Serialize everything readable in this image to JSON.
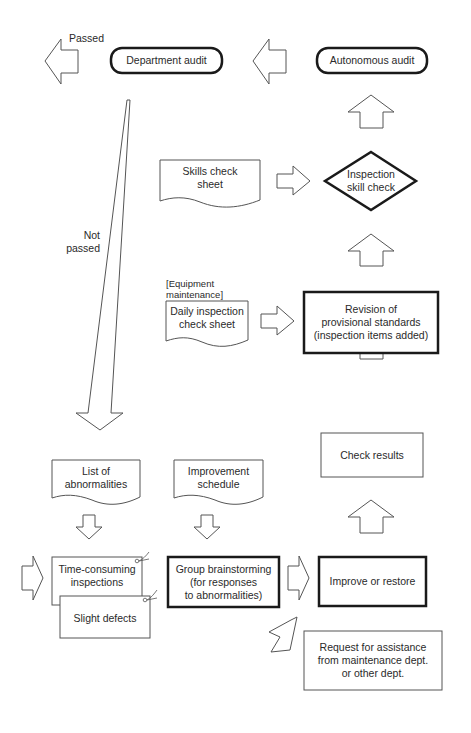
{
  "diagram": {
    "type": "flowchart",
    "nodes": {
      "department_audit": {
        "label": "Department audit",
        "shape": "rounded-pill"
      },
      "autonomous_audit": {
        "label": "Autonomous audit",
        "shape": "rounded-pill"
      },
      "skills_check_sheet": {
        "label_line1": "Skills check",
        "label_line2": "sheet",
        "shape": "document"
      },
      "inspection_skill_check": {
        "label_line1": "Inspection",
        "label_line2": "skill check",
        "shape": "diamond"
      },
      "equipment_maintenance_note": {
        "line1": "[Equipment",
        "line2": "maintenance]"
      },
      "daily_inspection_check_sheet": {
        "label_line1": "Daily inspection",
        "label_line2": "check sheet",
        "shape": "document"
      },
      "revision_of_standards": {
        "label_line1": "Revision of",
        "label_line2": "provisional standards",
        "label_line3": "(inspection items added)",
        "shape": "bold-rectangle"
      },
      "check_results": {
        "label": "Check results",
        "shape": "rectangle"
      },
      "list_of_abnormalities": {
        "label_line1": "List of",
        "label_line2": "abnormalities",
        "shape": "document"
      },
      "improvement_schedule": {
        "label_line1": "Improvement",
        "label_line2": "schedule",
        "shape": "document"
      },
      "time_consuming_inspections": {
        "label_line1": "Time-consuming",
        "label_line2": "inspections",
        "shape": "tag-card"
      },
      "slight_defects": {
        "label": "Slight defects",
        "shape": "tag-card"
      },
      "group_brainstorming": {
        "label_line1": "Group brainstorming",
        "label_line2": "(for responses",
        "label_line3": "to abnormalities)",
        "shape": "bold-rectangle"
      },
      "improve_or_restore": {
        "label": "Improve or restore",
        "shape": "bold-rectangle"
      },
      "request_for_assistance": {
        "label_line1": "Request for assistance",
        "label_line2": "from maintenance dept.",
        "label_line3": "or other dept.",
        "shape": "rectangle"
      }
    },
    "edge_labels": {
      "passed": "Passed",
      "not_passed_line1": "Not",
      "not_passed_line2": "passed"
    },
    "edges": [
      {
        "from": "improve_or_restore",
        "to": "check_results"
      },
      {
        "from": "check_results",
        "to": "revision_of_standards"
      },
      {
        "from": "revision_of_standards",
        "to": "inspection_skill_check"
      },
      {
        "from": "inspection_skill_check",
        "to": "autonomous_audit"
      },
      {
        "from": "autonomous_audit",
        "to": "department_audit"
      },
      {
        "from": "department_audit",
        "to": "exit",
        "label": "Passed"
      },
      {
        "from": "department_audit",
        "to": "list_of_abnormalities",
        "label": "Not passed"
      },
      {
        "from": "skills_check_sheet",
        "to": "inspection_skill_check"
      },
      {
        "from": "daily_inspection_check_sheet",
        "to": "revision_of_standards"
      },
      {
        "from": "list_of_abnormalities",
        "to": "time_consuming_inspections"
      },
      {
        "from": "improvement_schedule",
        "to": "group_brainstorming"
      },
      {
        "from": "group_brainstorming",
        "to": "improve_or_restore"
      },
      {
        "from": "group_brainstorming",
        "to": "request_for_assistance"
      }
    ],
    "colors": {
      "stroke": "#555555",
      "bold_stroke": "#1a1a1a",
      "text": "#2a2a2a",
      "background": "#ffffff"
    }
  }
}
